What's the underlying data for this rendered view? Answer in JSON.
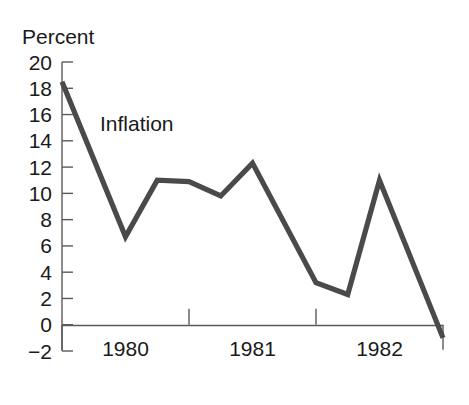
{
  "chart_data": {
    "type": "line",
    "title": "",
    "ylabel": "Percent",
    "xlabel": "",
    "ylim": [
      -2,
      20
    ],
    "yticks": [
      -2,
      0,
      2,
      4,
      6,
      8,
      10,
      12,
      14,
      16,
      18,
      20
    ],
    "ytick_labels": [
      "−2",
      "0",
      "2",
      "4",
      "6",
      "8",
      "10",
      "12",
      "14",
      "16",
      "18",
      "20"
    ],
    "xlim": [
      1979.75,
      1982.75
    ],
    "xtick_labels": [
      "1980",
      "1981",
      "1982"
    ],
    "xtick_positions": [
      1980.25,
      1981.25,
      1982.25
    ],
    "grid": false,
    "legend_position": "inline-annotation",
    "series": [
      {
        "name": "Inflation",
        "color": "#4a4a4a",
        "annotation": "Inflation",
        "x": [
          1979.75,
          1980.25,
          1980.5,
          1980.75,
          1981.0,
          1981.25,
          1981.75,
          1982.0,
          1982.25,
          1982.75
        ],
        "values": [
          18.5,
          6.7,
          11.0,
          10.9,
          9.8,
          12.3,
          3.2,
          2.3,
          11.0,
          -1.0
        ]
      }
    ]
  },
  "annotations": {
    "unit_label": "Percent",
    "series_label": "Inflation"
  },
  "colors": {
    "line": "#4a4a4a",
    "axis": "#5a5a5a",
    "text": "#1a1a1a",
    "background": "#ffffff"
  }
}
